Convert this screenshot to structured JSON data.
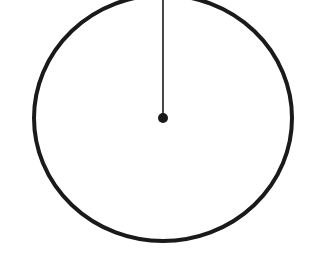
{
  "diagram": {
    "stroke_color": "#1a1a1a",
    "background": "#ffffff",
    "circle": {
      "cx": 163,
      "cy": 118,
      "rx": 129,
      "ry": 123
    },
    "center_point": {
      "x": 163,
      "y": 118,
      "r": 5
    },
    "radius_line": {
      "x1": 163,
      "y1": 118,
      "x2": 163,
      "y2": -5
    }
  }
}
